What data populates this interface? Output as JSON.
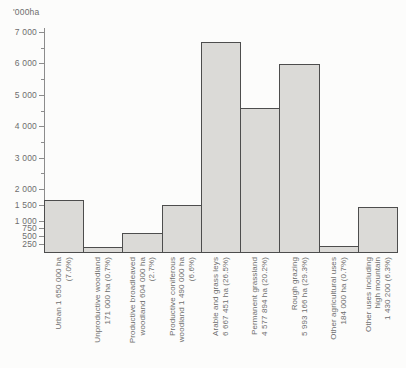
{
  "page": {
    "background": "#fcfcfb"
  },
  "chart_data": {
    "type": "bar",
    "title": "",
    "unit_label": "'000ha",
    "ylabel": "'000ha",
    "xlabel": "",
    "ylim": [
      0,
      7000
    ],
    "grid": false,
    "legend": false,
    "y_ticks": [
      {
        "value": 7000,
        "label": "7 000"
      },
      {
        "value": 6000,
        "label": "6 000"
      },
      {
        "value": 5000,
        "label": "5 000"
      },
      {
        "value": 4000,
        "label": "4 000"
      },
      {
        "value": 3000,
        "label": "3 000"
      },
      {
        "value": 2000,
        "label": "2 000"
      },
      {
        "value": 1500,
        "label": "1 500"
      },
      {
        "value": 1000,
        "label": "1 000"
      },
      {
        "value": 750,
        "label": "750"
      },
      {
        "value": 500,
        "label": "500"
      },
      {
        "value": 250,
        "label": "250"
      }
    ],
    "y_minor_ticks": [
      2500,
      3500,
      4500,
      5500,
      6500
    ],
    "categories": [
      "Urban",
      "Unproductive woodland",
      "Productive broadleaved woodland",
      "Productive coniferous woodland",
      "Arable and grass leys",
      "Permanent grassland",
      "Rough grazing",
      "Other agricultural uses",
      "Other uses including high mountain"
    ],
    "values": [
      1650,
      171,
      604,
      1490,
      6667.451,
      4577.894,
      5993.166,
      184,
      1430.2
    ],
    "bars": [
      {
        "category": "Urban",
        "area": "1 650 000 ha",
        "percent": "(7.0%)",
        "value_000ha": 1650,
        "label_lines": [
          "Urban 1 650 000 ha",
          "(7.0%)"
        ]
      },
      {
        "category": "Unproductive woodland",
        "area": "171 000 ha",
        "percent": "(0.7%)",
        "value_000ha": 171,
        "label_lines": [
          "Unproductive woodland",
          "171 000 ha (0.7%)"
        ]
      },
      {
        "category": "Productive broadleaved woodland",
        "area": "604 000 ha",
        "percent": "(2.7%)",
        "value_000ha": 604,
        "label_lines": [
          "Productive broadleaved",
          "woodland 604 000 ha",
          "(2.7%)"
        ]
      },
      {
        "category": "Productive coniferous woodland",
        "area": "1 490 000 ha",
        "percent": "(6.6%)",
        "value_000ha": 1490,
        "label_lines": [
          "Productive coniferous",
          "woodland 1 490 000 ha",
          "(6.6%)"
        ]
      },
      {
        "category": "Arable and grass leys",
        "area": "6 667 451 ha",
        "percent": "(26.5%)",
        "value_000ha": 6667.451,
        "label_lines": [
          "Arable and grass leys",
          "6 667 451 ha (26.5%)"
        ]
      },
      {
        "category": "Permanent grassland",
        "area": "4 577 894 ha",
        "percent": "(20.2%)",
        "value_000ha": 4577.894,
        "label_lines": [
          "Permanent grassland",
          "4 577 894 ha (20.2%)"
        ]
      },
      {
        "category": "Rough grazing",
        "area": "5 993 166 ha",
        "percent": "(29.3%)",
        "value_000ha": 5993.166,
        "label_lines": [
          "Rough grazing",
          "5 993 166 ha (29.3%)"
        ]
      },
      {
        "category": "Other agricultural uses",
        "area": "184 000 ha",
        "percent": "(0.7%)",
        "value_000ha": 184,
        "label_lines": [
          "Other agricultural uses",
          "184 000 ha (0.7%)"
        ]
      },
      {
        "category": "Other uses including high mountain",
        "area": "1 430 200",
        "percent": "(6.3%)",
        "value_000ha": 1430.2,
        "label_lines": [
          "Other uses including",
          "high mountain",
          "1 430 200 (6.3%)"
        ]
      }
    ],
    "colors": {
      "bar_fill": "#dbdad7",
      "bar_border": "#4d4d4d",
      "axis": "#8c8c8c",
      "text": "#6e6e6e",
      "background": "#fcfcfb"
    },
    "layout_hints": {
      "axis_x_px": 44,
      "baseline_y_px": 252,
      "top_y_px": 32,
      "plot_right_px": 397
    }
  }
}
